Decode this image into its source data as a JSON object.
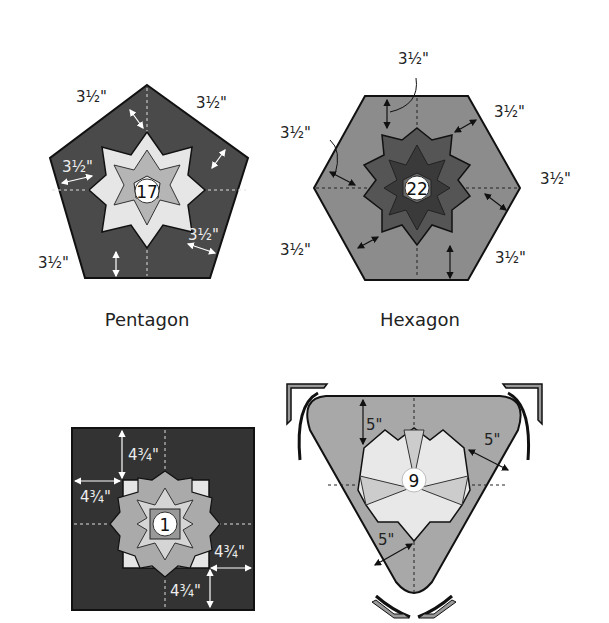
{
  "figures": [
    {
      "id": "pentagon",
      "caption": "Pentagon",
      "block_number": "17",
      "background_color": "#4a4a4a",
      "measurements": [
        "3½\"",
        "3½\"",
        "3½\"",
        "3½\"",
        "3½\""
      ]
    },
    {
      "id": "hexagon",
      "caption": "Hexagon",
      "block_number": "22",
      "background_color": "#8c8c8c",
      "measurements": [
        "3½\"",
        "3½\"",
        "3½\"",
        "3½\"",
        "3½\"",
        "3½\""
      ]
    },
    {
      "id": "square",
      "caption": "",
      "block_number": "1",
      "background_color": "#333333",
      "measurements": [
        "4¾\"",
        "4¾\"",
        "4¾\"",
        "4¾\""
      ]
    },
    {
      "id": "triangle",
      "caption": "",
      "block_number": "9",
      "background_color": "#a8a8a8",
      "measurements": [
        "5\"",
        "5\"",
        "5\""
      ]
    }
  ]
}
